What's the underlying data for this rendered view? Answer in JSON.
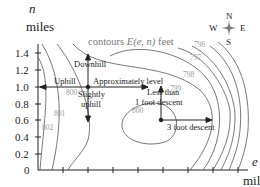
{
  "diagram": {
    "title": "contours E(e, n) feet",
    "title_prefix": "contours ",
    "title_func": "E(e, n)",
    "title_suffix": " feet",
    "y_axis": {
      "var": "n",
      "unit": "miles",
      "ticks": [
        "0",
        "0.2",
        "0.4",
        "0.6",
        "0.8",
        "1.0",
        "1.2",
        "1.4"
      ]
    },
    "x_axis": {
      "var": "e",
      "unit": "mile"
    },
    "contour_labels": [
      "796",
      "797",
      "798",
      "799",
      "800",
      "801",
      "802",
      "800"
    ],
    "annotations": {
      "downhill": "Downhill",
      "uphill": "Uphill",
      "approx_level": "Approximately level",
      "slightly": "Slightly",
      "uphill2": "uphill",
      "less_than": "Less than",
      "one_foot": "1 foot descent",
      "three_foot": "3 foot descent"
    },
    "compass": {
      "n": "N",
      "s": "S",
      "e": "E",
      "w": "W"
    },
    "colors": {
      "axis": "#222222",
      "contour": "#555555",
      "label": "#999999"
    }
  }
}
